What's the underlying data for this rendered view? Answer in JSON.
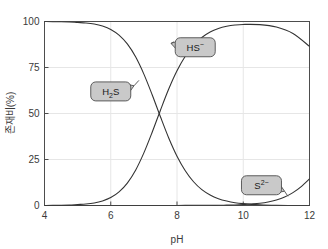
{
  "figure": {
    "background_color": "#ffffff",
    "plot_border_color": "#4d4d4d",
    "grid_color": "#e6e6e6",
    "curve_color": "#333333",
    "callout_fill": "#c9c9c9",
    "callout_stroke": "#4d4d4d"
  },
  "chart_data": {
    "type": "line",
    "title": "",
    "subtitle": "",
    "xlabel": "pH",
    "ylabel": "존재비(%)",
    "xlim": [
      4,
      12
    ],
    "ylim": [
      0,
      100
    ],
    "xticks": [
      4,
      6,
      8,
      10,
      12
    ],
    "yticks": [
      0,
      25,
      50,
      75,
      100
    ],
    "xtick_labels": [
      "4",
      "6",
      "8",
      "10",
      "12"
    ],
    "ytick_labels": [
      "0",
      "25",
      "50",
      "75",
      "100"
    ],
    "grid": true,
    "legend": "none",
    "annotations": [
      {
        "label": "H2S",
        "text_main": "H",
        "text_sub": "2",
        "text_tail": "S",
        "box_x": 6.0,
        "box_y": 62,
        "point_x": 6.85,
        "point_y": 68
      },
      {
        "label": "HS-",
        "text_main": "HS",
        "text_sup": "−",
        "box_x": 8.55,
        "box_y": 86,
        "point_x": 7.9,
        "point_y": 89
      },
      {
        "label": "S2-",
        "text_main": "S",
        "text_sup": "2−",
        "box_x": 10.55,
        "box_y": 11,
        "point_x": 11.35,
        "point_y": 5
      }
    ],
    "series": [
      {
        "name": "H2S",
        "color": "#333333",
        "x": [
          4.0,
          4.25,
          4.5,
          4.75,
          5.0,
          5.25,
          5.5,
          5.75,
          6.0,
          6.25,
          6.5,
          6.75,
          7.0,
          7.25,
          7.5,
          7.75,
          8.0,
          8.25,
          8.5,
          8.75,
          9.0,
          9.25,
          9.5,
          9.75,
          10.0,
          10.5,
          11.0,
          11.5,
          12.0
        ],
        "y": [
          100.0,
          99.9,
          99.9,
          99.8,
          99.5,
          99.2,
          98.6,
          97.5,
          95.7,
          92.6,
          87.8,
          80.8,
          71.4,
          60.2,
          48.2,
          36.7,
          26.8,
          18.9,
          12.9,
          8.6,
          5.7,
          3.7,
          2.4,
          1.5,
          1.0,
          0.4,
          0.1,
          0.0,
          0.0
        ]
      },
      {
        "name": "HS-",
        "color": "#333333",
        "x": [
          4.0,
          4.25,
          4.5,
          4.75,
          5.0,
          5.25,
          5.5,
          5.75,
          6.0,
          6.25,
          6.5,
          6.75,
          7.0,
          7.25,
          7.5,
          7.75,
          8.0,
          8.25,
          8.5,
          8.75,
          9.0,
          9.25,
          9.5,
          9.75,
          10.0,
          10.5,
          11.0,
          11.5,
          12.0
        ],
        "y": [
          0.0,
          0.1,
          0.1,
          0.2,
          0.5,
          0.8,
          1.4,
          2.5,
          4.3,
          7.4,
          12.2,
          19.2,
          28.6,
          39.8,
          51.8,
          63.3,
          73.2,
          81.1,
          87.0,
          91.3,
          94.3,
          96.2,
          97.4,
          98.1,
          98.4,
          98.3,
          97.0,
          93.5,
          86.5
        ]
      },
      {
        "name": "S2-",
        "color": "#333333",
        "x": [
          4.0,
          5.0,
          6.0,
          7.0,
          7.5,
          8.0,
          8.5,
          9.0,
          9.25,
          9.5,
          9.75,
          10.0,
          10.25,
          10.5,
          10.75,
          11.0,
          11.25,
          11.5,
          11.75,
          12.0
        ],
        "y": [
          0.0,
          0.0,
          0.0,
          0.0,
          0.0,
          0.0,
          0.1,
          0.1,
          0.1,
          0.2,
          0.3,
          0.5,
          0.8,
          1.2,
          1.9,
          3.0,
          4.6,
          7.0,
          10.3,
          14.5
        ]
      }
    ]
  }
}
